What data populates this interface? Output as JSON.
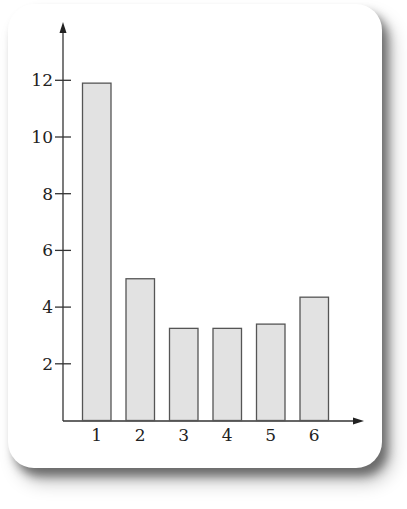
{
  "chart_data": {
    "type": "bar",
    "title": "",
    "xlabel": "",
    "ylabel": "",
    "categories": [
      "1",
      "2",
      "3",
      "4",
      "5",
      "6"
    ],
    "values": [
      11.9,
      5.0,
      3.25,
      3.25,
      3.4,
      4.35
    ],
    "ylim": [
      0,
      13.9
    ],
    "yticks": [
      2,
      4,
      6,
      8,
      10,
      12
    ],
    "grid": false,
    "legend": null,
    "colors": {
      "bar_fill": "#e2e2e2",
      "bar_edge": "#555555",
      "axis": "#333333"
    }
  },
  "axes": {
    "y_tick_labels": [
      "2",
      "4",
      "6",
      "8",
      "10",
      "12"
    ],
    "x_tick_labels": [
      "1",
      "2",
      "3",
      "4",
      "5",
      "6"
    ]
  }
}
